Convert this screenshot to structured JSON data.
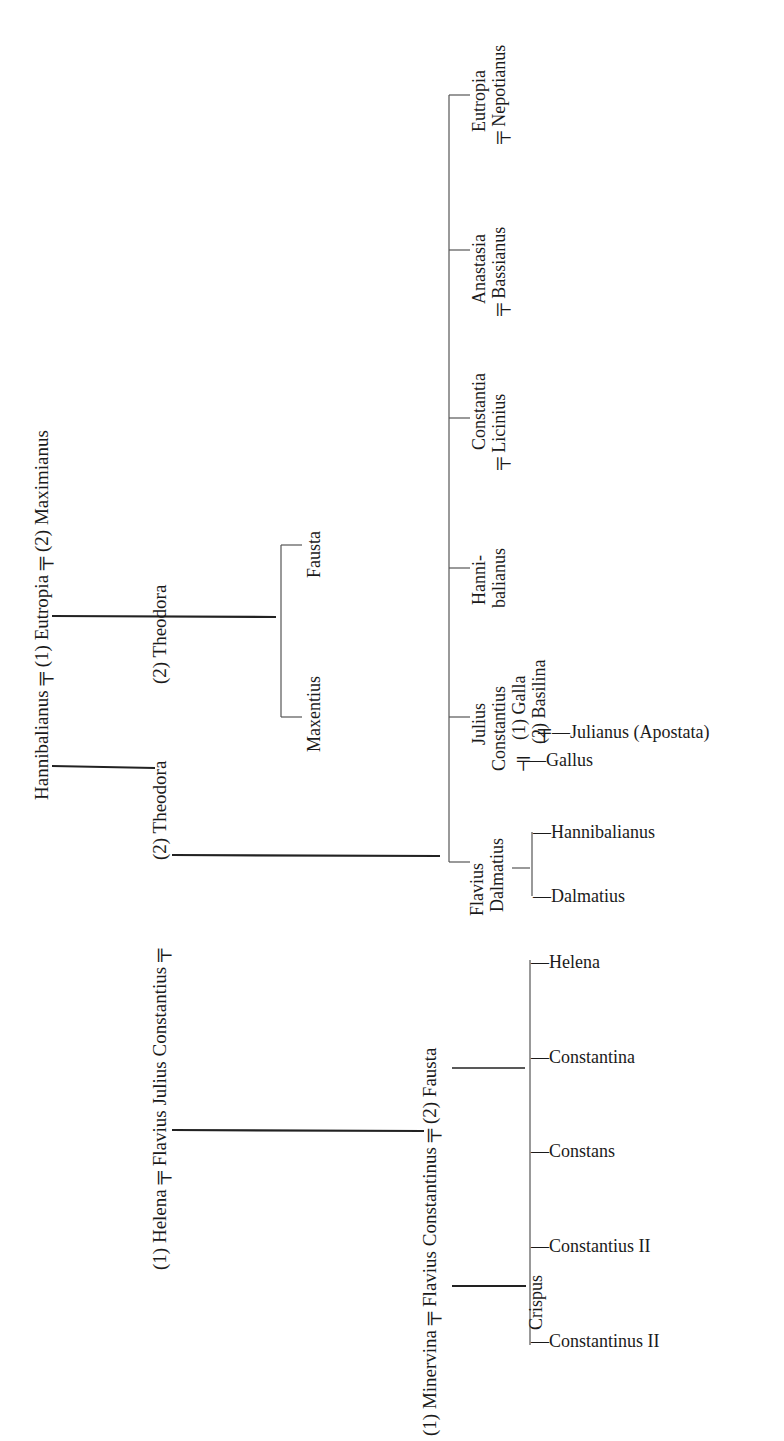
{
  "diagram": {
    "type": "genealogical-tree",
    "marriage_symbol": "╤",
    "nodes": {
      "gen1": {
        "hannibalianus_line": {
          "husband": "Hannibalianus",
          "spouse1": "(1) Eutropia",
          "spouse2": "(2) Maximianus"
        },
        "constantius_line": {
          "spouse1": "(1) Helena",
          "person": "Flavius Julius Constantius",
          "spouse2": "(2) Theodora"
        },
        "theodora_label": "(2) Theodora"
      },
      "maximianus_children": [
        "Maxentius",
        "Fausta"
      ],
      "constantius_theodora_children": [
        {
          "name1": "Flavius",
          "name2": "Dalmatius"
        },
        {
          "name1": "Julius",
          "name2": "Constantius",
          "spouse1": "(1) Galla",
          "spouse2": "(2) Basilina"
        },
        {
          "name1": "Hanni-",
          "name2": "balianus"
        },
        {
          "name1": "Constantia",
          "spouse": "Licinius"
        },
        {
          "name1": "Anastasia",
          "spouse": "Bassianus"
        },
        {
          "name1": "Eutropia",
          "spouse": "Nepotianus"
        }
      ],
      "dalmatius_children": [
        "Hannibalianus",
        "Dalmatius"
      ],
      "julius_constantius_children": {
        "by_basilina": "Julianus (Apostata)",
        "by_galla": "Gallus"
      },
      "constantinus_line": {
        "spouse1": "(1) Minervina",
        "person": "Flavius Constantinus",
        "spouse2": "(2) Fausta"
      },
      "constantinus_fausta_children": [
        "Helena",
        "Constantina",
        "Constans",
        "Constantius II",
        "Constantinus II"
      ],
      "constantinus_minervina_children": [
        "Crispus"
      ]
    },
    "display": {
      "hannibalianus": "Hannibalianus",
      "eutropia1": "(1) Eutropia",
      "maximianus2": "(2) Maximianus",
      "theodora": "(2) Theodora",
      "helena1": "(1) Helena",
      "fjc": "Flavius Julius Constantius",
      "maxentius": "Maxentius",
      "fausta_daughter": "Fausta",
      "flavius": "Flavius",
      "dalmatius_father": "Dalmatius",
      "julius": "Julius",
      "constantius_jc": "Constantius",
      "galla": "(1) Galla",
      "basilina": "(2) Basilina",
      "hanni": "Hanni-",
      "balianus": "balianus",
      "constantia": "Constantia",
      "licinius": "Licinius",
      "anastasia": "Anastasia",
      "bassianus": "Bassianus",
      "eutropia_d": "Eutropia",
      "nepotianus": "Nepotianus",
      "hannibalianus_jr": "—Hannibalianus",
      "dalmatius_jr": "—Dalmatius",
      "julianus": "—Julianus (Apostata)",
      "gallus": "—Gallus",
      "minervina": "(1) Minervina",
      "flavius_constantinus": "Flavius Constantinus",
      "fausta2": "(2) Fausta",
      "helena_d": "—Helena",
      "constantina": "—Constantina",
      "constans": "—Constans",
      "constantius2": "—Constantius II",
      "constantinus2": "—Constantinus II",
      "crispus": "Crispus",
      "marriage": "╤"
    }
  }
}
